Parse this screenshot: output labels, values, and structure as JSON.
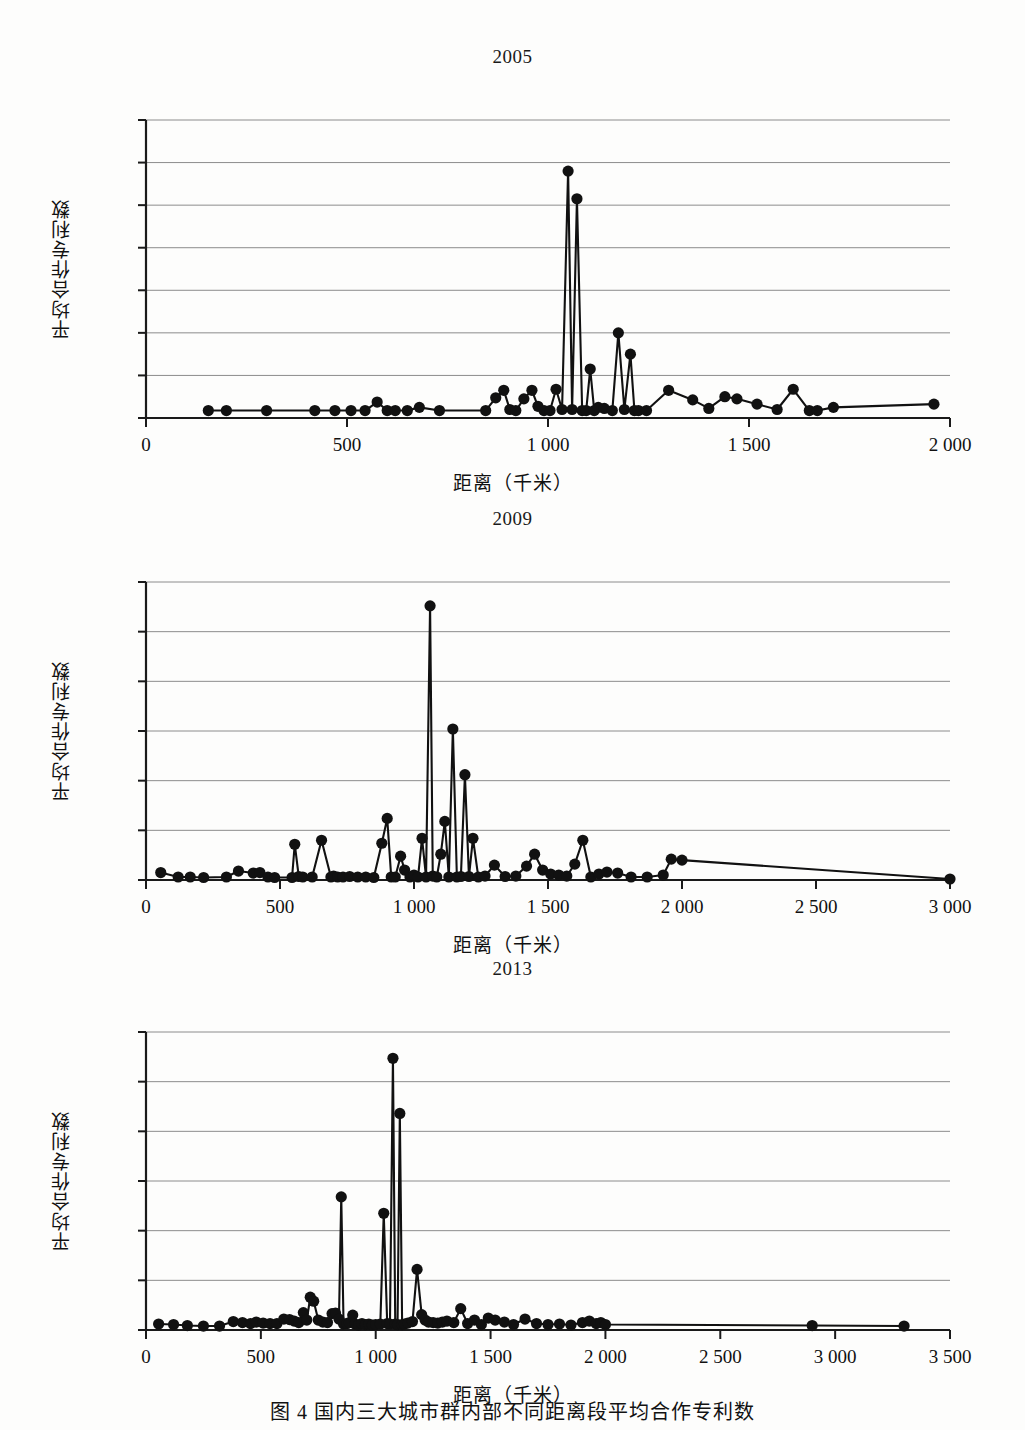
{
  "figure": {
    "caption": "图 4   国内三大城市群内部不同距离段平均合作专利数",
    "axis_x_label": "距离（千米）",
    "axis_y_label": "平均合作专利数"
  },
  "chart_data": [
    {
      "type": "line",
      "title": "2005",
      "xlabel": "距离（千米）",
      "ylabel": "平均合作专利数",
      "xlim": [
        0,
        2000
      ],
      "ylim": [
        0,
        14
      ],
      "xticks": [
        "0",
        "500",
        "1 000",
        "1 500",
        "2 000"
      ],
      "xtick_values": [
        0,
        500,
        1000,
        1500,
        2000
      ],
      "yticks": [
        "0.0",
        "2.0",
        "4.0",
        "6.0",
        "8.0",
        "10.0",
        "12.0",
        "14.0"
      ],
      "ytick_values": [
        0,
        2,
        4,
        6,
        8,
        10,
        12,
        14
      ],
      "grid": true,
      "legend": "none",
      "markers": true,
      "x": [
        155,
        200,
        300,
        420,
        470,
        510,
        545,
        575,
        600,
        620,
        650,
        680,
        730,
        845,
        870,
        890,
        905,
        920,
        940,
        960,
        975,
        990,
        1005,
        1020,
        1035,
        1050,
        1060,
        1072,
        1085,
        1095,
        1105,
        1115,
        1125,
        1140,
        1160,
        1175,
        1190,
        1205,
        1215,
        1225,
        1245,
        1300,
        1360,
        1400,
        1440,
        1470,
        1520,
        1570,
        1610,
        1650,
        1670,
        1710,
        1960
      ],
      "y": [
        0.35,
        0.35,
        0.35,
        0.35,
        0.35,
        0.35,
        0.35,
        0.75,
        0.35,
        0.35,
        0.35,
        0.5,
        0.35,
        0.35,
        0.95,
        1.3,
        0.4,
        0.35,
        0.9,
        1.3,
        0.55,
        0.35,
        0.35,
        1.35,
        0.4,
        11.6,
        0.4,
        10.3,
        0.35,
        0.35,
        2.3,
        0.35,
        0.5,
        0.45,
        0.35,
        4.0,
        0.4,
        3.0,
        0.35,
        0.35,
        0.35,
        1.3,
        0.85,
        0.45,
        1.0,
        0.9,
        0.65,
        0.4,
        1.35,
        0.35,
        0.35,
        0.5,
        0.65
      ]
    },
    {
      "type": "line",
      "title": "2009",
      "xlabel": "距离（千米）",
      "ylabel": "平均合作专利数",
      "xlim": [
        0,
        3000
      ],
      "ylim": [
        0,
        30
      ],
      "xticks": [
        "0",
        "500",
        "1 000",
        "1 500",
        "2 000",
        "2 500",
        "3 000"
      ],
      "xtick_values": [
        0,
        500,
        1000,
        1500,
        2000,
        2500,
        3000
      ],
      "yticks": [
        "0.0",
        "5.0",
        "10.0",
        "15.0",
        "20.0",
        "25.0",
        "30.0"
      ],
      "ytick_values": [
        0,
        5,
        10,
        15,
        20,
        25,
        30
      ],
      "grid": true,
      "legend": "none",
      "markers": true,
      "x": [
        55,
        120,
        165,
        215,
        300,
        345,
        400,
        425,
        455,
        480,
        545,
        555,
        570,
        585,
        620,
        655,
        690,
        700,
        715,
        735,
        760,
        790,
        820,
        850,
        880,
        900,
        915,
        930,
        950,
        965,
        985,
        1000,
        1015,
        1030,
        1045,
        1060,
        1070,
        1085,
        1100,
        1115,
        1130,
        1145,
        1160,
        1175,
        1190,
        1205,
        1220,
        1240,
        1265,
        1300,
        1340,
        1380,
        1420,
        1450,
        1480,
        1510,
        1540,
        1570,
        1600,
        1630,
        1660,
        1690,
        1720,
        1760,
        1810,
        1870,
        1930,
        1960,
        2000,
        3000
      ],
      "y": [
        0.75,
        0.3,
        0.3,
        0.25,
        0.3,
        0.9,
        0.7,
        0.75,
        0.3,
        0.25,
        0.25,
        3.6,
        0.35,
        0.3,
        0.3,
        4.0,
        0.3,
        0.4,
        0.3,
        0.3,
        0.35,
        0.3,
        0.3,
        0.25,
        3.7,
        6.2,
        0.3,
        0.3,
        2.4,
        1.0,
        0.3,
        0.5,
        0.3,
        4.2,
        0.3,
        27.6,
        0.4,
        0.3,
        2.6,
        5.9,
        0.3,
        15.2,
        0.3,
        0.35,
        10.6,
        0.35,
        4.2,
        0.3,
        0.4,
        1.5,
        0.35,
        0.4,
        1.4,
        2.6,
        1.0,
        0.6,
        0.5,
        0.4,
        1.6,
        4.0,
        0.3,
        0.6,
        0.8,
        0.7,
        0.3,
        0.3,
        0.5,
        2.1,
        2.0,
        0.1
      ]
    },
    {
      "type": "line",
      "title": "2013",
      "xlabel": "距离（千米）",
      "ylabel": "平均合作专利数",
      "xlim": [
        0,
        3500
      ],
      "ylim": [
        0,
        60
      ],
      "xticks": [
        "0",
        "500",
        "1 000",
        "1 500",
        "2 000",
        "2 500",
        "3 000",
        "3 500"
      ],
      "xtick_values": [
        0,
        500,
        1000,
        1500,
        2000,
        2500,
        3000,
        3500
      ],
      "yticks": [
        "0.0",
        "10.0",
        "20.0",
        "30.0",
        "40.0",
        "50.0",
        "60.0"
      ],
      "ytick_values": [
        0,
        10,
        20,
        30,
        40,
        50,
        60
      ],
      "grid": true,
      "legend": "none",
      "markers": true,
      "x": [
        55,
        120,
        180,
        250,
        320,
        380,
        420,
        455,
        480,
        510,
        540,
        570,
        600,
        625,
        645,
        665,
        685,
        700,
        715,
        730,
        750,
        770,
        790,
        810,
        825,
        840,
        850,
        860,
        875,
        885,
        900,
        910,
        925,
        940,
        955,
        970,
        985,
        1000,
        1020,
        1035,
        1050,
        1062,
        1075,
        1085,
        1095,
        1105,
        1115,
        1125,
        1140,
        1160,
        1180,
        1200,
        1215,
        1230,
        1250,
        1270,
        1290,
        1310,
        1340,
        1370,
        1400,
        1430,
        1460,
        1490,
        1520,
        1560,
        1600,
        1650,
        1700,
        1750,
        1800,
        1850,
        1900,
        1930,
        1960,
        1980,
        2000,
        2900,
        3300
      ],
      "y": [
        1.2,
        1.1,
        0.9,
        0.8,
        0.8,
        1.7,
        1.5,
        1.3,
        1.6,
        1.4,
        1.3,
        1.3,
        2.2,
        2.1,
        1.8,
        1.5,
        3.5,
        2.0,
        6.6,
        5.8,
        2.0,
        1.6,
        1.5,
        3.3,
        3.4,
        2.2,
        26.8,
        1.2,
        1.3,
        1.5,
        3.0,
        1.2,
        1.0,
        1.3,
        1.1,
        1.2,
        1.0,
        1.1,
        1.2,
        23.5,
        1.3,
        1.2,
        54.7,
        1.2,
        1.1,
        43.6,
        1.1,
        1.2,
        1.4,
        1.7,
        12.2,
        3.1,
        2.0,
        1.6,
        1.5,
        1.4,
        1.6,
        1.8,
        1.5,
        4.3,
        1.3,
        2.0,
        1.1,
        2.4,
        2.0,
        1.6,
        1.1,
        2.2,
        1.3,
        1.1,
        1.2,
        1.0,
        1.5,
        1.8,
        1.3,
        1.5,
        1.1,
        0.9,
        0.8
      ]
    }
  ]
}
